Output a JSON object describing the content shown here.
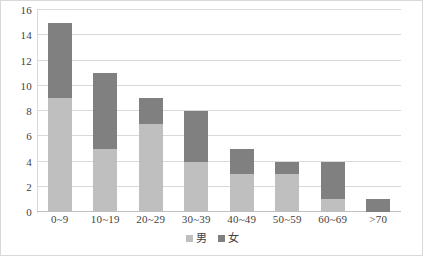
{
  "chart_data": {
    "type": "bar",
    "subtype": "stacked-bar",
    "title": "",
    "subtitle": "",
    "xlabel": "",
    "ylabel": "",
    "categories": [
      "0~9",
      "10~19",
      "20~29",
      "30~39",
      "40~49",
      "50~59",
      "60~69",
      ">70"
    ],
    "series": [
      {
        "name": "男",
        "color": "#bfbfbf",
        "values": [
          9,
          5,
          7,
          4,
          3,
          3,
          1,
          0
        ]
      },
      {
        "name": "女",
        "color": "#808080",
        "values": [
          6,
          6,
          2,
          4,
          2,
          1,
          3,
          1
        ]
      }
    ],
    "totals": [
      15,
      11,
      9,
      8,
      5,
      4,
      4,
      1
    ],
    "ylim": [
      0,
      16
    ],
    "ytick_step": 2,
    "yticks": [
      0,
      2,
      4,
      6,
      8,
      10,
      12,
      14,
      16
    ],
    "ytick_labels": [
      "0",
      "2",
      "4",
      "6",
      "8",
      "10",
      "12",
      "14",
      "16"
    ],
    "grid": "horizontal",
    "legend_position": "bottom-center",
    "legend": [
      "男",
      "女"
    ]
  },
  "legend": {
    "items": [
      {
        "label": "男",
        "swatch": "legend-swatch-male"
      },
      {
        "label": "女",
        "swatch": "legend-swatch-female"
      }
    ]
  },
  "colors": {
    "male": "#bfbfbf",
    "female": "#808080",
    "gridline": "#d9d9d9",
    "text": "#3f3f3f",
    "background": "#ffffff",
    "border": "#d9d9d9"
  }
}
